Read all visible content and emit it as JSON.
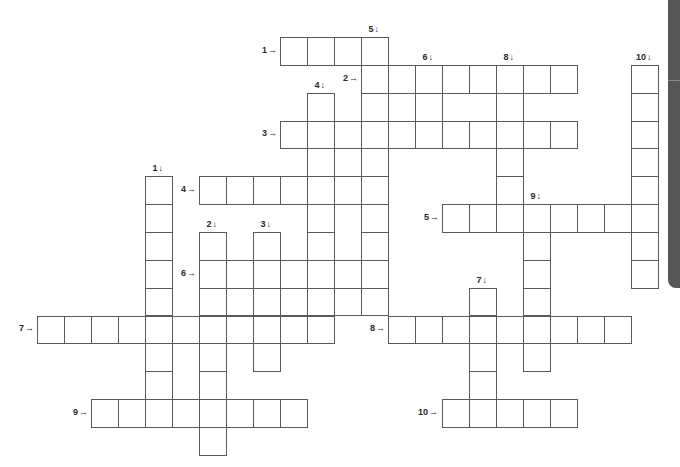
{
  "puzzle": {
    "type": "crossword",
    "grid": {
      "origin_x": 37,
      "origin_y": 37,
      "cell_width": 27,
      "cell_height": 27.85,
      "line_color": "#5a5a5a"
    },
    "cells": [
      [
        0,
        9
      ],
      [
        0,
        10
      ],
      [
        0,
        11
      ],
      [
        0,
        12
      ],
      [
        1,
        12
      ],
      [
        1,
        13
      ],
      [
        1,
        14
      ],
      [
        1,
        15
      ],
      [
        1,
        16
      ],
      [
        1,
        17
      ],
      [
        1,
        18
      ],
      [
        1,
        19
      ],
      [
        1,
        22
      ],
      [
        2,
        10
      ],
      [
        2,
        12
      ],
      [
        2,
        13
      ],
      [
        2,
        14
      ],
      [
        2,
        17
      ],
      [
        2,
        22
      ],
      [
        3,
        9
      ],
      [
        3,
        10
      ],
      [
        3,
        11
      ],
      [
        3,
        12
      ],
      [
        3,
        13
      ],
      [
        3,
        14
      ],
      [
        3,
        15
      ],
      [
        3,
        16
      ],
      [
        3,
        17
      ],
      [
        3,
        18
      ],
      [
        3,
        19
      ],
      [
        3,
        22
      ],
      [
        4,
        10
      ],
      [
        4,
        11
      ],
      [
        4,
        12
      ],
      [
        4,
        17
      ],
      [
        4,
        22
      ],
      [
        5,
        4
      ],
      [
        5,
        6
      ],
      [
        5,
        7
      ],
      [
        5,
        8
      ],
      [
        5,
        9
      ],
      [
        5,
        10
      ],
      [
        5,
        11
      ],
      [
        5,
        12
      ],
      [
        5,
        17
      ],
      [
        5,
        22
      ],
      [
        6,
        4
      ],
      [
        6,
        10
      ],
      [
        6,
        12
      ],
      [
        6,
        15
      ],
      [
        6,
        16
      ],
      [
        6,
        17
      ],
      [
        6,
        18
      ],
      [
        6,
        19
      ],
      [
        6,
        20
      ],
      [
        6,
        21
      ],
      [
        6,
        22
      ],
      [
        7,
        4
      ],
      [
        7,
        6
      ],
      [
        7,
        8
      ],
      [
        7,
        10
      ],
      [
        7,
        12
      ],
      [
        7,
        18
      ],
      [
        7,
        22
      ],
      [
        8,
        4
      ],
      [
        8,
        6
      ],
      [
        8,
        7
      ],
      [
        8,
        8
      ],
      [
        8,
        9
      ],
      [
        8,
        10
      ],
      [
        8,
        11
      ],
      [
        8,
        12
      ],
      [
        8,
        18
      ],
      [
        8,
        22
      ],
      [
        9,
        4
      ],
      [
        9,
        6
      ],
      [
        9,
        7
      ],
      [
        9,
        8
      ],
      [
        9,
        9
      ],
      [
        9,
        10
      ],
      [
        9,
        11
      ],
      [
        9,
        12
      ],
      [
        9,
        16
      ],
      [
        9,
        18
      ],
      [
        10,
        0
      ],
      [
        10,
        1
      ],
      [
        10,
        2
      ],
      [
        10,
        3
      ],
      [
        10,
        4
      ],
      [
        10,
        5
      ],
      [
        10,
        6
      ],
      [
        10,
        7
      ],
      [
        10,
        8
      ],
      [
        10,
        9
      ],
      [
        10,
        10
      ],
      [
        10,
        13
      ],
      [
        10,
        14
      ],
      [
        10,
        15
      ],
      [
        10,
        16
      ],
      [
        10,
        17
      ],
      [
        10,
        18
      ],
      [
        10,
        19
      ],
      [
        10,
        20
      ],
      [
        10,
        21
      ],
      [
        11,
        4
      ],
      [
        11,
        6
      ],
      [
        11,
        8
      ],
      [
        11,
        16
      ],
      [
        11,
        18
      ],
      [
        12,
        4
      ],
      [
        12,
        6
      ],
      [
        12,
        16
      ],
      [
        13,
        2
      ],
      [
        13,
        3
      ],
      [
        13,
        4
      ],
      [
        13,
        5
      ],
      [
        13,
        6
      ],
      [
        13,
        7
      ],
      [
        13,
        8
      ],
      [
        13,
        9
      ],
      [
        13,
        15
      ],
      [
        13,
        16
      ],
      [
        13,
        17
      ],
      [
        13,
        18
      ],
      [
        13,
        19
      ],
      [
        14,
        6
      ]
    ],
    "across": [
      {
        "number": "1",
        "label": "1",
        "arrow": "→",
        "row": 0,
        "col": 9,
        "length": 4
      },
      {
        "number": "2",
        "label": "2",
        "arrow": "→",
        "row": 1,
        "col": 12,
        "length": 8
      },
      {
        "number": "3",
        "label": "3",
        "arrow": "→",
        "row": 3,
        "col": 9,
        "length": 11
      },
      {
        "number": "4",
        "label": "4",
        "arrow": "→",
        "row": 5,
        "col": 6,
        "length": 7
      },
      {
        "number": "5",
        "label": "5",
        "arrow": "→",
        "row": 6,
        "col": 15,
        "length": 8
      },
      {
        "number": "6",
        "label": "6",
        "arrow": "→",
        "row": 8,
        "col": 6,
        "length": 7
      },
      {
        "number": "7",
        "label": "7",
        "arrow": "→",
        "row": 10,
        "col": 0,
        "length": 11
      },
      {
        "number": "8",
        "label": "8",
        "arrow": "→",
        "row": 10,
        "col": 13,
        "length": 9
      },
      {
        "number": "9",
        "label": "9",
        "arrow": "→",
        "row": 13,
        "col": 2,
        "length": 8
      },
      {
        "number": "10",
        "label": "10",
        "arrow": "→",
        "row": 13,
        "col": 15,
        "length": 5
      }
    ],
    "down": [
      {
        "number": "1",
        "label": "1",
        "arrow": "↓",
        "row": 5,
        "col": 4,
        "length": 9
      },
      {
        "number": "2",
        "label": "2",
        "arrow": "↓",
        "row": 7,
        "col": 6,
        "length": 8
      },
      {
        "number": "3",
        "label": "3",
        "arrow": "↓",
        "row": 7,
        "col": 8,
        "length": 5
      },
      {
        "number": "4",
        "label": "4",
        "arrow": "↓",
        "row": 2,
        "col": 10,
        "length": 9
      },
      {
        "number": "5",
        "label": "5",
        "arrow": "↓",
        "row": 0,
        "col": 12,
        "length": 10
      },
      {
        "number": "6",
        "label": "6",
        "arrow": "↓",
        "row": 1,
        "col": 14,
        "length": 3
      },
      {
        "number": "7",
        "label": "7",
        "arrow": "↓",
        "row": 9,
        "col": 16,
        "length": 5
      },
      {
        "number": "8",
        "label": "8",
        "arrow": "↓",
        "row": 1,
        "col": 17,
        "length": 6
      },
      {
        "number": "9",
        "label": "9",
        "arrow": "↓",
        "row": 6,
        "col": 18,
        "length": 6
      },
      {
        "number": "10",
        "label": "10",
        "arrow": "↓",
        "row": 1,
        "col": 22,
        "length": 8
      }
    ]
  },
  "side_tab": {
    "color": "#565656"
  }
}
